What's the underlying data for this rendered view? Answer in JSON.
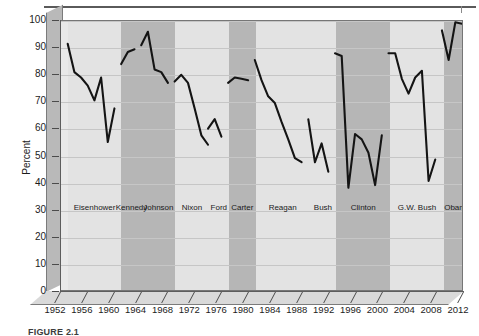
{
  "figure": {
    "caption": "FIGURE 2.1"
  },
  "chart_data": {
    "type": "line",
    "title": "",
    "xlabel": "",
    "ylabel": "Percent",
    "ylim": [
      0,
      100
    ],
    "ytick_values": [
      0,
      10,
      20,
      30,
      40,
      50,
      60,
      70,
      80,
      90,
      100
    ],
    "ytick_labels": [
      "0",
      "10",
      "20",
      "30",
      "40",
      "50",
      "60",
      "70",
      "80",
      "90",
      "100"
    ],
    "xlim": [
      1952,
      2012
    ],
    "xtick_values": [
      1952,
      1956,
      1960,
      1964,
      1968,
      1972,
      1976,
      1980,
      1984,
      1988,
      1992,
      1996,
      2000,
      2004,
      2008,
      2012
    ],
    "xtick_labels": [
      "1952",
      "1956",
      "1960",
      "1964",
      "1968",
      "1972",
      "1976",
      "1980",
      "1984",
      "1988",
      "1992",
      "1996",
      "2000",
      "2004",
      "2008",
      "2012"
    ],
    "grid": "horizontal",
    "legend": "none",
    "series": [
      {
        "name": "Eisenhower",
        "x": [
          1953,
          1954,
          1955,
          1956,
          1957,
          1958,
          1959,
          1960
        ],
        "values": [
          91.5,
          81.0,
          79.0,
          76.0,
          70.5,
          79.0,
          55.0,
          67.5
        ]
      },
      {
        "name": "Kennedy",
        "x": [
          1961,
          1962,
          1963
        ],
        "values": [
          84.0,
          88.5,
          89.5
        ]
      },
      {
        "name": "Johnson",
        "x": [
          1964,
          1965,
          1966,
          1967,
          1968
        ],
        "values": [
          91.0,
          96.0,
          82.0,
          81.0,
          77.0
        ]
      },
      {
        "name": "Nixon",
        "x": [
          1969,
          1970,
          1971,
          1972,
          1973,
          1974
        ],
        "values": [
          77.5,
          80.0,
          77.0,
          67.5,
          57.5,
          54.0
        ]
      },
      {
        "name": "Ford",
        "x": [
          1974,
          1975,
          1976
        ],
        "values": [
          60.0,
          63.5,
          57.0
        ]
      },
      {
        "name": "Carter",
        "x": [
          1977,
          1978,
          1979,
          1980
        ],
        "values": [
          77.0,
          79.0,
          78.5,
          78.0
        ]
      },
      {
        "name": "Reagan",
        "x": [
          1981,
          1982,
          1983,
          1984,
          1985,
          1986,
          1987,
          1988
        ],
        "values": [
          85.5,
          78.0,
          72.0,
          69.5,
          62.5,
          56.0,
          49.0,
          47.5
        ]
      },
      {
        "name": "Bush",
        "x": [
          1989,
          1990,
          1991,
          1992
        ],
        "values": [
          63.5,
          47.5,
          54.5,
          44.0
        ]
      },
      {
        "name": "Clinton",
        "x": [
          1993,
          1994,
          1995,
          1996,
          1997,
          1998,
          1999,
          2000
        ],
        "values": [
          88.0,
          87.0,
          38.0,
          58.0,
          56.0,
          51.0,
          39.0,
          57.5
        ]
      },
      {
        "name": "G.W. Bush",
        "x": [
          2001,
          2002,
          2003,
          2004,
          2005,
          2006,
          2007,
          2008
        ],
        "values": [
          88.0,
          88.0,
          78.5,
          73.0,
          79.0,
          81.5,
          40.5,
          48.5
        ]
      },
      {
        "name": "Obama",
        "x": [
          2009,
          2010,
          2011,
          2012
        ],
        "values": [
          96.5,
          85.5,
          99.5,
          99.0
        ]
      }
    ],
    "bands": [
      {
        "label": "Eisenhower",
        "start": 1953,
        "end": 1961,
        "party": "rep"
      },
      {
        "label": "Kennedy",
        "start": 1961,
        "end": 1964,
        "party": "dem"
      },
      {
        "label": "Johnson",
        "start": 1964,
        "end": 1969,
        "party": "dem"
      },
      {
        "label": "Nixon",
        "start": 1969,
        "end": 1974,
        "party": "rep"
      },
      {
        "label": "Ford",
        "start": 1974,
        "end": 1977,
        "party": "rep"
      },
      {
        "label": "Carter",
        "start": 1977,
        "end": 1981,
        "party": "dem"
      },
      {
        "label": "Reagan",
        "start": 1981,
        "end": 1989,
        "party": "rep"
      },
      {
        "label": "Bush",
        "start": 1989,
        "end": 1993,
        "party": "rep"
      },
      {
        "label": "Clinton",
        "start": 1993,
        "end": 2001,
        "party": "dem"
      },
      {
        "label": "G.W. Bush",
        "start": 2001,
        "end": 2009,
        "party": "rep"
      },
      {
        "label": "Obama",
        "start": 2009,
        "end": 2013,
        "party": "dem"
      }
    ],
    "colors": {
      "line": "#141414",
      "republican_band": "#e3e3e3",
      "democrat_band": "#b6b6b6",
      "plot_background": "#e9e9e9",
      "gridline": "#c6c6c6"
    }
  }
}
